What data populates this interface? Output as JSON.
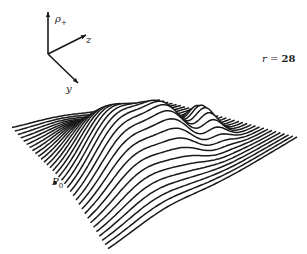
{
  "chart_data": {
    "type": "surface3d",
    "title": "",
    "annotation": {
      "param_name": "r",
      "param_value": "28",
      "text": "r = 28"
    },
    "axes": {
      "vertical": {
        "label": "ρ",
        "subscript": "+"
      },
      "depth": {
        "label": "z"
      },
      "horizontal": {
        "label": "y"
      }
    },
    "markers": [
      {
        "label": "P",
        "subscript": "0",
        "position": "front-left edge of surface"
      }
    ],
    "grid": false,
    "legend": null,
    "style": {
      "line_color": "#1a1a1a",
      "background": "#ffffff",
      "line_count": 34
    }
  },
  "labels": {
    "rho": "ρ",
    "rho_sub": "+",
    "z": "z",
    "y": "y",
    "r_text": "r = ",
    "r_value": "28",
    "p": "P",
    "p_sub": "0"
  },
  "geometry": {
    "axis_origin": [
      48,
      54
    ],
    "axis_rho_end": [
      48,
      12
    ],
    "axis_z_end": [
      86,
      35
    ],
    "axis_y_end": [
      78,
      83
    ],
    "base_quad": {
      "left": [
        12,
        128
      ],
      "back": [
        160,
        100
      ],
      "right": [
        297,
        137
      ],
      "front": [
        108,
        250
      ]
    },
    "peaks": [
      {
        "u": 0.3,
        "v": 0.55,
        "height": 62,
        "su": 0.16,
        "sv": 0.22
      },
      {
        "u": 0.55,
        "v": 0.62,
        "height": 38,
        "su": 0.1,
        "sv": 0.12
      },
      {
        "u": 0.78,
        "v": 0.58,
        "height": 30,
        "su": 0.06,
        "sv": 0.1
      }
    ]
  }
}
